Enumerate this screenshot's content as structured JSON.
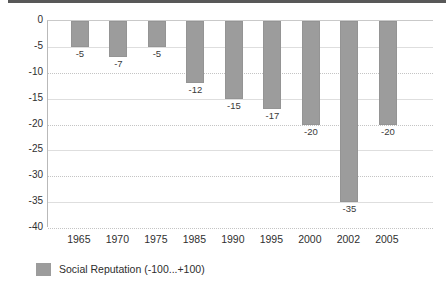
{
  "decor": {
    "top_rule_color": "#585858"
  },
  "legend": {
    "swatch_name": "legend-color-swatch",
    "label": "Social Reputation (-100...+100)",
    "color": "#9c9c9c",
    "position": "bottom-left"
  },
  "chart_data": {
    "type": "bar",
    "title": "",
    "subtitle": "",
    "xlabel": "",
    "ylabel": "",
    "categories": [
      "1965",
      "1970",
      "1975",
      "1985",
      "1990",
      "1995",
      "2000",
      "2002",
      "2005"
    ],
    "values": [
      -5,
      -7,
      -5,
      -12,
      -15,
      -17,
      -20,
      -35,
      -20
    ],
    "data_labels": [
      "-5",
      "-7",
      "-5",
      "-12",
      "-15",
      "-17",
      "-20",
      "-35",
      "-20"
    ],
    "series": [
      {
        "name": "Social Reputation (-100...+100)",
        "color": "#9c9c9c",
        "values": [
          -5,
          -7,
          -5,
          -12,
          -15,
          -17,
          -20,
          -35,
          -20
        ]
      }
    ],
    "ylim": [
      -40,
      0
    ],
    "yticks": [
      0,
      -5,
      -10,
      -15,
      -20,
      -25,
      -30,
      -35,
      -40
    ],
    "ytick_labels": [
      "0",
      "-5",
      "-10",
      "-15",
      "-20",
      "-25",
      "-30",
      "-35",
      "-40"
    ],
    "grid": true,
    "grid_axis": "y",
    "legend_position": "bottom-left",
    "bar_color": "#9c9c9c",
    "background": "#ffffff"
  }
}
